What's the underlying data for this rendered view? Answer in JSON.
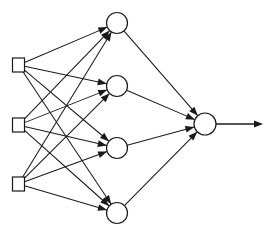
{
  "diagram": {
    "kind": "neural-network-diagram",
    "title": "",
    "canvas": {
      "width": 275,
      "height": 233,
      "background": "#ffffff"
    },
    "style": {
      "line_color": "#1a1a1a",
      "node_fill": "#ffffff",
      "node_stroke": "#1a1a1a",
      "line_width": 1.05,
      "arrow_length": 9,
      "arrow_half_width": 3.4
    },
    "layers": [
      {
        "id": "input",
        "name": "input-layer",
        "shape": "square",
        "count": 3,
        "nodes": [
          {
            "id": "i1",
            "name": "input-node-1",
            "label": "",
            "cx": 18.5,
            "cy": 65,
            "w": 12,
            "h": 14
          },
          {
            "id": "i2",
            "name": "input-node-2",
            "label": "",
            "cx": 18.5,
            "cy": 125,
            "w": 12,
            "h": 14
          },
          {
            "id": "i3",
            "name": "input-node-3",
            "label": "",
            "cx": 18.5,
            "cy": 184,
            "w": 12,
            "h": 14
          }
        ]
      },
      {
        "id": "hidden",
        "name": "hidden-layer",
        "shape": "circle",
        "count": 4,
        "nodes": [
          {
            "id": "h1",
            "name": "hidden-node-1",
            "label": "",
            "cx": 117,
            "cy": 23,
            "r": 10.5
          },
          {
            "id": "h2",
            "name": "hidden-node-2",
            "label": "",
            "cx": 117,
            "cy": 86,
            "r": 10.5
          },
          {
            "id": "h3",
            "name": "hidden-node-3",
            "label": "",
            "cx": 117,
            "cy": 148,
            "r": 10.5
          },
          {
            "id": "h4",
            "name": "hidden-node-4",
            "label": "",
            "cx": 117,
            "cy": 213,
            "r": 10.5
          }
        ]
      },
      {
        "id": "output",
        "name": "output-layer",
        "shape": "circle",
        "count": 1,
        "nodes": [
          {
            "id": "o1",
            "name": "output-node-1",
            "label": "",
            "cx": 205,
            "cy": 124,
            "r": 11
          }
        ]
      }
    ],
    "edges": [
      {
        "from": "i1",
        "to": "h1",
        "arrow": true
      },
      {
        "from": "i1",
        "to": "h2",
        "arrow": true
      },
      {
        "from": "i1",
        "to": "h3",
        "arrow": true
      },
      {
        "from": "i1",
        "to": "h4",
        "arrow": true
      },
      {
        "from": "i2",
        "to": "h1",
        "arrow": true
      },
      {
        "from": "i2",
        "to": "h2",
        "arrow": true
      },
      {
        "from": "i2",
        "to": "h3",
        "arrow": true
      },
      {
        "from": "i2",
        "to": "h4",
        "arrow": true
      },
      {
        "from": "i3",
        "to": "h1",
        "arrow": true
      },
      {
        "from": "i3",
        "to": "h2",
        "arrow": true
      },
      {
        "from": "i3",
        "to": "h3",
        "arrow": true
      },
      {
        "from": "i3",
        "to": "h4",
        "arrow": true
      },
      {
        "from": "h1",
        "to": "o1",
        "arrow": true
      },
      {
        "from": "h2",
        "to": "o1",
        "arrow": true
      },
      {
        "from": "h3",
        "to": "o1",
        "arrow": true
      },
      {
        "from": "h4",
        "to": "o1",
        "arrow": true
      }
    ],
    "output_arrow": {
      "name": "output-arrow",
      "x1": 216,
      "y1": 124,
      "x2": 263,
      "y2": 124,
      "arrow": true
    }
  }
}
